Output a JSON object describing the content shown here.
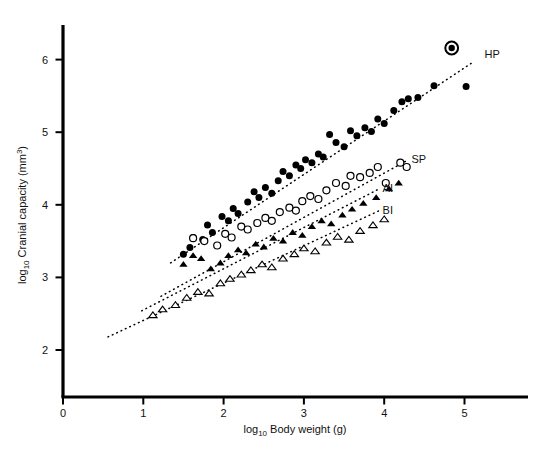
{
  "chart_data": {
    "type": "scatter",
    "title": "",
    "xlabel": "log10 Body weight (g)",
    "ylabel": "log10 Cranial capacity (mm3)",
    "xlabel_parts": {
      "prefix": "log",
      "sub": "10",
      "rest": " Body weight (g)"
    },
    "ylabel_parts": {
      "prefix": "log",
      "sub": "10",
      "rest": " Cranial capacity (mm",
      "sup": "3",
      "tail": ")"
    },
    "xlim": [
      0,
      5.7
    ],
    "ylim": [
      1.55,
      6.45
    ],
    "xticks": [
      0,
      1,
      2,
      3,
      4,
      5
    ],
    "yticks": [
      2,
      3,
      4,
      5,
      6
    ],
    "xtick_labels": [
      "0",
      "1",
      "2",
      "3",
      "4",
      "5"
    ],
    "ytick_labels": [
      "2",
      "3",
      "4",
      "5",
      "6"
    ],
    "grid": false,
    "legend_position": "inline-right-of-lines",
    "series": [
      {
        "name": "HP",
        "label": "HP",
        "marker": "filled-circle",
        "color": "#000000",
        "label_xy": [
          5.25,
          6.02
        ],
        "points": [
          [
            1.5,
            3.32
          ],
          [
            1.58,
            3.41
          ],
          [
            1.62,
            3.55
          ],
          [
            1.74,
            3.52
          ],
          [
            1.8,
            3.72
          ],
          [
            1.86,
            3.62
          ],
          [
            1.98,
            3.84
          ],
          [
            2.06,
            3.78
          ],
          [
            2.12,
            3.95
          ],
          [
            2.18,
            3.88
          ],
          [
            2.3,
            4.04
          ],
          [
            2.38,
            4.18
          ],
          [
            2.44,
            4.1
          ],
          [
            2.52,
            4.24
          ],
          [
            2.6,
            4.16
          ],
          [
            2.68,
            4.33
          ],
          [
            2.74,
            4.46
          ],
          [
            2.82,
            4.4
          ],
          [
            2.9,
            4.55
          ],
          [
            2.96,
            4.5
          ],
          [
            3.02,
            4.62
          ],
          [
            3.1,
            4.58
          ],
          [
            3.18,
            4.7
          ],
          [
            3.24,
            4.66
          ],
          [
            3.32,
            4.97
          ],
          [
            3.4,
            4.86
          ],
          [
            3.5,
            4.8
          ],
          [
            3.58,
            5.02
          ],
          [
            3.66,
            4.95
          ],
          [
            3.76,
            5.06
          ],
          [
            3.84,
            5.01
          ],
          [
            3.92,
            5.18
          ],
          [
            4.0,
            5.12
          ],
          [
            4.12,
            5.3
          ],
          [
            4.22,
            5.42
          ],
          [
            4.3,
            5.46
          ],
          [
            4.42,
            5.48
          ],
          [
            4.62,
            5.64
          ],
          [
            5.02,
            5.63
          ]
        ]
      },
      {
        "name": "SP",
        "label": "SP",
        "marker": "open-circle",
        "color": "#000000",
        "label_xy": [
          4.34,
          4.58
        ],
        "points": [
          [
            1.62,
            3.54
          ],
          [
            1.76,
            3.5
          ],
          [
            1.92,
            3.44
          ],
          [
            2.02,
            3.6
          ],
          [
            2.1,
            3.55
          ],
          [
            2.22,
            3.7
          ],
          [
            2.3,
            3.66
          ],
          [
            2.42,
            3.75
          ],
          [
            2.52,
            3.82
          ],
          [
            2.6,
            3.78
          ],
          [
            2.7,
            3.9
          ],
          [
            2.82,
            3.96
          ],
          [
            2.9,
            3.92
          ],
          [
            2.98,
            4.05
          ],
          [
            3.08,
            4.12
          ],
          [
            3.18,
            4.08
          ],
          [
            3.28,
            4.2
          ],
          [
            3.4,
            4.3
          ],
          [
            3.52,
            4.26
          ],
          [
            3.58,
            4.4
          ],
          [
            3.7,
            4.38
          ],
          [
            3.82,
            4.44
          ],
          [
            3.92,
            4.52
          ],
          [
            4.02,
            4.3
          ],
          [
            4.2,
            4.58
          ],
          [
            4.28,
            4.52
          ]
        ]
      },
      {
        "name": "AI",
        "label": "AI",
        "marker": "filled-triangle",
        "color": "#000000",
        "label_xy": [
          3.98,
          4.18
        ],
        "points": [
          [
            1.5,
            3.18
          ],
          [
            1.62,
            3.3
          ],
          [
            1.72,
            3.26
          ],
          [
            1.84,
            3.12
          ],
          [
            1.96,
            3.2
          ],
          [
            2.06,
            3.3
          ],
          [
            2.18,
            3.38
          ],
          [
            2.28,
            3.34
          ],
          [
            2.4,
            3.46
          ],
          [
            2.5,
            3.42
          ],
          [
            2.62,
            3.54
          ],
          [
            2.74,
            3.5
          ],
          [
            2.86,
            3.62
          ],
          [
            2.98,
            3.58
          ],
          [
            3.1,
            3.7
          ],
          [
            3.22,
            3.78
          ],
          [
            3.34,
            3.74
          ],
          [
            3.48,
            3.86
          ],
          [
            3.6,
            3.94
          ],
          [
            3.74,
            4.02
          ],
          [
            3.9,
            4.1
          ],
          [
            4.06,
            4.22
          ],
          [
            4.18,
            4.3
          ]
        ]
      },
      {
        "name": "BI",
        "label": "BI",
        "marker": "open-triangle",
        "color": "#000000",
        "label_xy": [
          3.98,
          3.88
        ],
        "points": [
          [
            1.12,
            2.48
          ],
          [
            1.24,
            2.56
          ],
          [
            1.4,
            2.62
          ],
          [
            1.54,
            2.72
          ],
          [
            1.68,
            2.8
          ],
          [
            1.82,
            2.78
          ],
          [
            1.96,
            2.92
          ],
          [
            2.08,
            2.98
          ],
          [
            2.22,
            3.04
          ],
          [
            2.34,
            3.1
          ],
          [
            2.48,
            3.18
          ],
          [
            2.6,
            3.14
          ],
          [
            2.74,
            3.26
          ],
          [
            2.88,
            3.32
          ],
          [
            3.0,
            3.4
          ],
          [
            3.14,
            3.36
          ],
          [
            3.28,
            3.48
          ],
          [
            3.42,
            3.56
          ],
          [
            3.56,
            3.52
          ],
          [
            3.7,
            3.64
          ],
          [
            3.86,
            3.72
          ],
          [
            4.0,
            3.8
          ]
        ]
      },
      {
        "name": "Highlighted specimen",
        "label": "",
        "marker": "bullseye",
        "color": "#000000",
        "points": [
          [
            4.84,
            6.16
          ]
        ]
      }
    ],
    "trend_lines": [
      {
        "name": "HP",
        "style": "dotted",
        "x0": 1.34,
        "y0": 3.2,
        "x1": 5.1,
        "y1": 5.96
      },
      {
        "name": "SP",
        "style": "dotted",
        "x0": 1.22,
        "y0": 2.74,
        "x1": 4.3,
        "y1": 4.62
      },
      {
        "name": "AI",
        "style": "dotted",
        "x0": 0.98,
        "y0": 2.54,
        "x1": 3.94,
        "y1": 4.22
      },
      {
        "name": "BI",
        "style": "dotted",
        "x0": 0.56,
        "y0": 2.18,
        "x1": 3.94,
        "y1": 3.92
      }
    ]
  }
}
